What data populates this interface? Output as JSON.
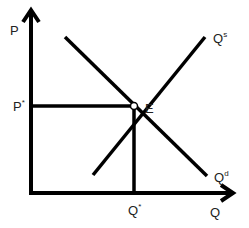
{
  "diagram": {
    "type": "supply-demand",
    "axes": {
      "y_label": "P",
      "x_label": "Q"
    },
    "curves": [
      {
        "name": "supply",
        "label_base": "Q",
        "label_sup": "s",
        "from": [
          93,
          175
        ],
        "to": [
          205,
          37
        ]
      },
      {
        "name": "demand",
        "label_base": "Q",
        "label_sup": "d",
        "from": [
          65,
          37
        ],
        "to": [
          207,
          176
        ]
      }
    ],
    "equilibrium": {
      "label": "E",
      "price_label_base": "P",
      "price_label_sup": "*",
      "quantity_label_base": "Q",
      "quantity_label_sup": "*",
      "point": [
        134,
        106
      ]
    },
    "colors": {
      "line": "#000000",
      "text": "#222222",
      "background": "#ffffff"
    }
  }
}
